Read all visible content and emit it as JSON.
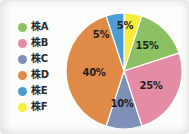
{
  "chart_data": {
    "type": "pie",
    "title": "",
    "subtitle": "",
    "xlabel": "",
    "ylabel": "",
    "legend_position": "left",
    "grid": false,
    "categories": [
      "株A",
      "株B",
      "株C",
      "株D",
      "株E",
      "株F"
    ],
    "values": [
      15,
      25,
      10,
      40,
      5,
      5
    ],
    "value_labels": [
      "15%",
      "25%",
      "10%",
      "40%",
      "5%",
      "5%"
    ],
    "colors": [
      "#8cc163",
      "#e58ca5",
      "#7e90b8",
      "#e08a48",
      "#4a9ed4",
      "#f7ee3a"
    ],
    "start_angle_deg": 0,
    "direction": "clockwise",
    "slice_order_clockwise_from_top": [
      "株F",
      "株A",
      "株B",
      "株C",
      "株D",
      "株E"
    ]
  },
  "legend": {
    "items": [
      {
        "label": "株A",
        "color": "#8cc163",
        "value_label": "15%"
      },
      {
        "label": "株B",
        "color": "#e58ca5",
        "value_label": "25%"
      },
      {
        "label": "株C",
        "color": "#7e90b8",
        "value_label": "10%"
      },
      {
        "label": "株D",
        "color": "#e08a48",
        "value_label": "40%"
      },
      {
        "label": "株E",
        "color": "#4a9ed4",
        "value_label": "5%"
      },
      {
        "label": "株F",
        "color": "#f7ee3a",
        "value_label": "5%"
      }
    ]
  },
  "pie": {
    "slices": [
      {
        "name": "株F",
        "value_label": "5%",
        "color": "#f7ee3a",
        "label_x": 60,
        "label_y": 13
      },
      {
        "name": "株A",
        "value_label": "15%",
        "color": "#8cc163",
        "label_x": 82,
        "label_y": 33
      },
      {
        "name": "株B",
        "value_label": "25%",
        "color": "#e58ca5",
        "label_x": 86,
        "label_y": 73
      },
      {
        "name": "株C",
        "value_label": "10%",
        "color": "#7e90b8",
        "label_x": 57,
        "label_y": 91
      },
      {
        "name": "株D",
        "value_label": "40%",
        "color": "#e08a48",
        "label_x": 29,
        "label_y": 60
      },
      {
        "name": "株E",
        "value_label": "5%",
        "color": "#4a9ed4",
        "label_x": 36,
        "label_y": 22
      }
    ]
  }
}
